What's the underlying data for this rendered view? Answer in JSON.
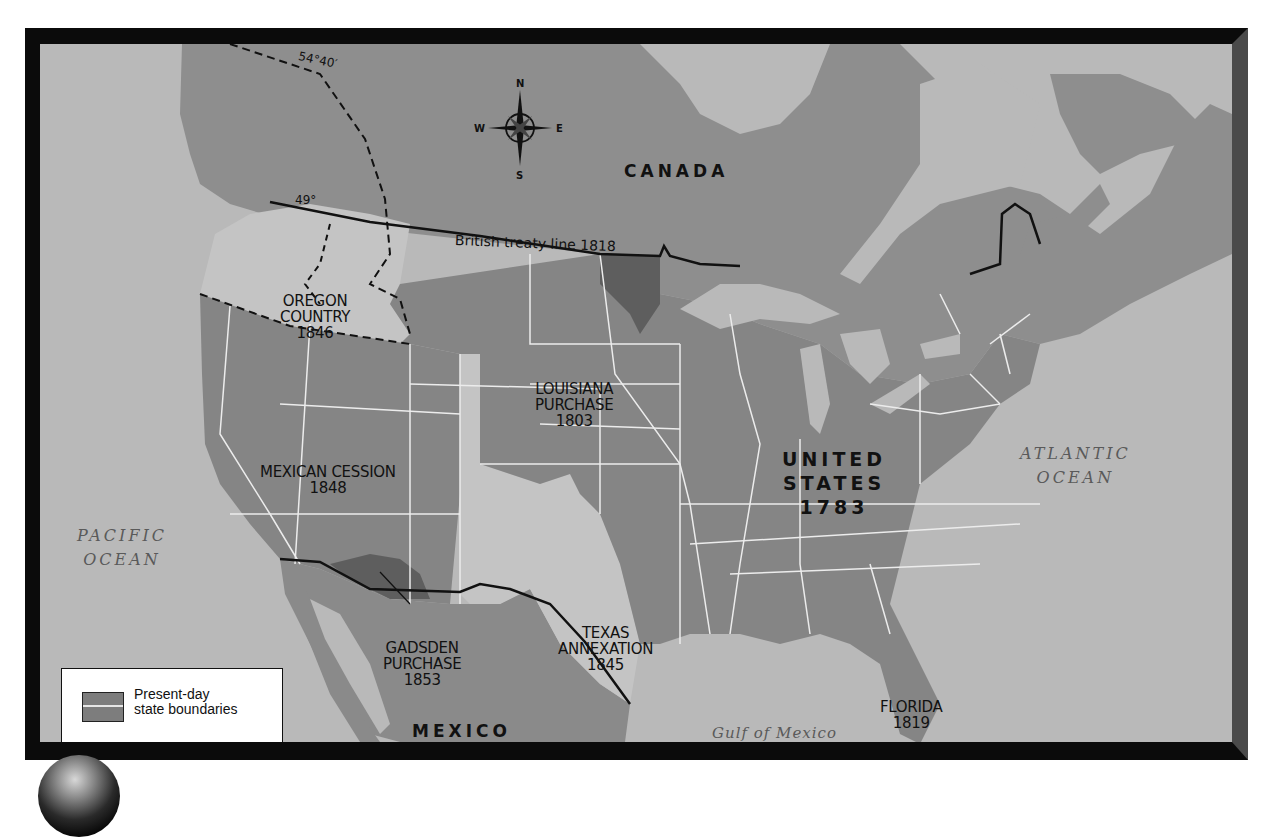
{
  "map": {
    "title": "U.S. territorial expansion",
    "compass": {
      "north": "N",
      "south": "S",
      "east": "E",
      "west": "W"
    },
    "countries": {
      "canada": "CANADA",
      "mexico": "MEXICO"
    },
    "united_states": {
      "line1": "UNITED",
      "line2": "STATES",
      "year": "1783"
    },
    "regions": [
      {
        "name": "OREGON",
        "name2": "COUNTRY",
        "year": "1846"
      },
      {
        "name": "LOUISIANA",
        "name2": "PURCHASE",
        "year": "1803"
      },
      {
        "name": "MEXICAN CESSION",
        "year": "1848"
      },
      {
        "name": "TEXAS",
        "name2": "ANNEXATION",
        "year": "1845"
      },
      {
        "name": "GADSDEN",
        "name2": "PURCHASE",
        "year": "1853"
      },
      {
        "name": "FLORIDA",
        "year": "1819"
      }
    ],
    "water": {
      "pacific_1": "PACIFIC",
      "pacific_2": "OCEAN",
      "atlantic_1": "ATLANTIC",
      "atlantic_2": "OCEAN",
      "gulf": "Gulf of Mexico"
    },
    "lines": {
      "treaty": "British treaty line 1818",
      "lat_49": "49°",
      "lat_5440": "54°40′"
    },
    "legend": {
      "line1": "Present-day",
      "line2": "state boundaries"
    },
    "colors": {
      "water": "#b9b9b9",
      "foreign_land": "#8e8e8e",
      "us_land": "#858585",
      "light_acquisition": "#c4c4c4",
      "dark_acquisition": "#5e5e5e",
      "frame": "#0b0b0b"
    }
  }
}
